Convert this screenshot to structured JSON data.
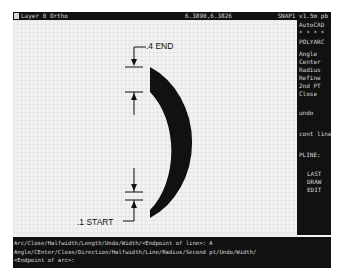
{
  "status_bar": {
    "layer": "Layer 0 Ortho",
    "coordinates": "6.3890,6.3826",
    "right_text": "SNAP1 v1.5m pb"
  },
  "side_menu": {
    "items": [
      {
        "label": "AutoCAD"
      },
      {
        "label": "* * * *"
      },
      {
        "label": "POLYARC"
      },
      {
        "label": "Angle"
      },
      {
        "label": "Center"
      },
      {
        "label": "Radius"
      },
      {
        "label": "Refine"
      },
      {
        "label": "2nd PT"
      },
      {
        "label": "Close"
      },
      {
        "label": "undo"
      },
      {
        "label": "cont line"
      },
      {
        "label": "PLINE:"
      },
      {
        "label": "LAST"
      },
      {
        "label": "DRAW"
      },
      {
        "label": "EDIT"
      }
    ]
  },
  "drawing": {
    "end_label": ".4 END",
    "start_label": ".1 START",
    "end_width": 0.4,
    "start_width": 0.1
  },
  "command_line": {
    "lines": [
      "Arc/Close/Halfwidth/Length/Undo/Width/<Endpoint of line>: A",
      "Angle/CEnter/Close/Direction/Halfwidth/Line/Radius/Second pt/Undo/Width/",
      "<Endpoint of arc>:"
    ]
  },
  "colors": {
    "bar": "#111111",
    "text": "#d8d8d8",
    "canvas": "#f3f3f3",
    "ink": "#111111"
  }
}
